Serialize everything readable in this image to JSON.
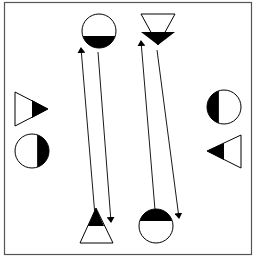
{
  "diagram": {
    "frame": {
      "x": 4.5,
      "y": 2.5,
      "width": 247,
      "height": 252,
      "stroke": "#555555"
    },
    "colors": {
      "fill_dark": "#000000",
      "fill_light": "#ffffff",
      "stroke": "#000000"
    },
    "shapes": [
      {
        "id": "top-circle",
        "type": "circle",
        "cx": 99,
        "cy": 31,
        "r": 17,
        "filled_part": "bottom"
      },
      {
        "id": "top-triangle",
        "type": "triangle",
        "points": "141,14 175,14 158,45",
        "direction": "down",
        "filled_part": "tip",
        "clip": "141,32 175,32 158,45"
      },
      {
        "id": "left-triangle",
        "type": "triangle",
        "points": "15,92 15,126 48,109",
        "direction": "right",
        "filled_part": "tip",
        "clip": "32,100 32,118 48,109"
      },
      {
        "id": "left-circle",
        "type": "circle",
        "cx": 32,
        "cy": 151,
        "r": 17,
        "filled_part": "right"
      },
      {
        "id": "right-circle",
        "type": "circle",
        "cx": 224,
        "cy": 107,
        "r": 17,
        "filled_part": "left"
      },
      {
        "id": "right-triangle",
        "type": "triangle",
        "points": "241,135 241,168 207,151",
        "direction": "left",
        "filled_part": "tip",
        "clip": "224,143 224,160 207,151"
      },
      {
        "id": "bottom-triangle",
        "type": "triangle",
        "points": "96,208 80,243 113,243",
        "direction": "up",
        "filled_part": "tip",
        "clip": "96,208 88,226 104,226"
      },
      {
        "id": "bottom-circle",
        "type": "circle",
        "cx": 156,
        "cy": 226,
        "r": 17,
        "filled_part": "top"
      }
    ],
    "arrows": [
      {
        "id": "arrow-up-left",
        "x1": 95,
        "y1": 216,
        "x2": 81,
        "y2": 48
      },
      {
        "id": "arrow-down-left",
        "x1": 98,
        "y1": 52,
        "x2": 111,
        "y2": 222
      },
      {
        "id": "arrow-up-right",
        "x1": 155,
        "y1": 210,
        "x2": 141,
        "y2": 41
      },
      {
        "id": "arrow-down-right",
        "x1": 157,
        "y1": 50,
        "x2": 179,
        "y2": 218
      }
    ]
  }
}
